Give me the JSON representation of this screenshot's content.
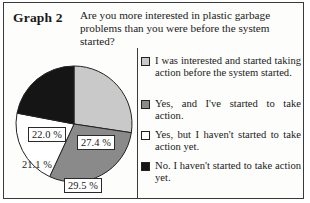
{
  "figure": {
    "graph_label": "Graph 2",
    "question": "Are you more interested in plastic garbage problems than you were before the system started?"
  },
  "chart_data": {
    "type": "pie",
    "title": "Are you more interested in plastic garbage problems than you were before the system started?",
    "xlabel": "",
    "ylabel": "",
    "start_angle_deg": 0,
    "direction": "clockwise",
    "legend_position": "right",
    "grid": false,
    "categories": [
      "I was interested and started taking action before the system started.",
      "Yes, and I've started to take action.",
      "Yes, but I haven't started to take action yet.",
      "No.  I haven't started to take action yet."
    ],
    "values": [
      27.4,
      29.5,
      21.1,
      22.0
    ],
    "value_labels": [
      "27.4 %",
      "29.5 %",
      "21.1 %",
      "22.0 %"
    ],
    "colors": [
      "#c9c9c9",
      "#8a8a8a",
      "#ffffff",
      "#151515"
    ],
    "label_text_colors": [
      "#1a1a1a",
      "#1a1a1a",
      "#1a1a1a",
      "#1a1a1a"
    ],
    "label_boxed": [
      true,
      true,
      false,
      true
    ],
    "slice_outline_color": "#222222",
    "units": "percent"
  },
  "legend": {
    "items": [
      {
        "label": "I was interested and started taking action before the system started.",
        "swatch_color": "#c9c9c9",
        "swatch_name": "legend-swatch-light-gray"
      },
      {
        "label": "Yes, and I've started to take action.",
        "swatch_color": "#8a8a8a",
        "swatch_name": "legend-swatch-medium-gray"
      },
      {
        "label": "Yes, but I haven't started to take action yet.",
        "swatch_color": "#ffffff",
        "swatch_name": "legend-swatch-white"
      },
      {
        "label": "No.  I haven't started to take action yet.",
        "swatch_color": "#151515",
        "swatch_name": "legend-swatch-black"
      }
    ]
  }
}
